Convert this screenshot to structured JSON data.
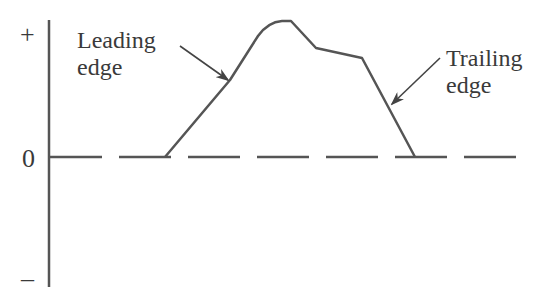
{
  "diagram": {
    "type": "pulse-waveform",
    "y_axis": {
      "ticks": [
        {
          "label": "+",
          "position": "top"
        },
        {
          "label": "0",
          "position": "baseline"
        },
        {
          "label": "–",
          "position": "bottom"
        }
      ]
    },
    "annotations": {
      "leading_edge": {
        "line1": "Leading",
        "line2": "edge"
      },
      "trailing_edge": {
        "line1": "Trailing",
        "line2": "edge"
      }
    },
    "colors": {
      "stroke": "#555555",
      "text": "#3a3a3a",
      "background": "#ffffff"
    }
  }
}
